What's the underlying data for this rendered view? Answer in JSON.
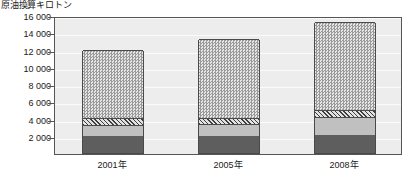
{
  "chart_data": {
    "type": "bar",
    "title": "",
    "subtitle": "",
    "xlabel": "",
    "ylabel": "原油換算キロトン",
    "ylim": [
      0,
      16000
    ],
    "ytick_labels": [
      "16 000",
      "14 000",
      "12 000",
      "10 000",
      "8 000",
      "6 000",
      "4 000",
      "2 000"
    ],
    "ytick_values": [
      16000,
      14000,
      12000,
      10000,
      8000,
      6000,
      4000,
      2000
    ],
    "grid": true,
    "legend": "none",
    "stacked": true,
    "categories": [
      "2001年",
      "2005年",
      "2008年"
    ],
    "series": [
      {
        "name": "segment-1-dark",
        "pattern": "solid-dark",
        "values": [
          2000,
          2000,
          2100
        ]
      },
      {
        "name": "segment-2-light",
        "pattern": "solid-light",
        "values": [
          1300,
          1400,
          2100
        ]
      },
      {
        "name": "segment-3-hatched",
        "pattern": "diagonal-hatch",
        "values": [
          800,
          700,
          800
        ]
      },
      {
        "name": "segment-4-checkered",
        "pattern": "checker",
        "values": [
          7800,
          9100,
          10200
        ]
      }
    ],
    "totals": [
      11900,
      13200,
      15200
    ]
  },
  "axis": {
    "y_title": "原油換算キロトン"
  },
  "colors": {
    "plot_background": "#ededed",
    "axis_line": "#555555",
    "gridline": "#fbfbfb",
    "segment_dark": "#5e5e5e",
    "segment_light": "#c0c0c0",
    "segment_hatch": "#e2e2e2",
    "segment_check": "#cfcfcf",
    "text": "#1a1a1a",
    "page_background": "#ffffff"
  }
}
